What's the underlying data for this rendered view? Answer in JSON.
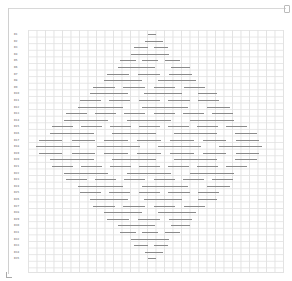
{
  "chart_data": {
    "type": "diamond-grid",
    "title": "",
    "row_count": 35,
    "row_labels": [
      "R1",
      "R2",
      "R3",
      "R4",
      "R5",
      "R6",
      "R7",
      "R8",
      "R9",
      "R10",
      "R11",
      "R12",
      "R13",
      "R14",
      "R15",
      "R16",
      "R17",
      "R18",
      "R19",
      "R20",
      "R21",
      "R22",
      "R23",
      "R24",
      "R25",
      "R26",
      "R27",
      "R28",
      "R29",
      "R30",
      "R31",
      "R32",
      "R33",
      "R34",
      "R35"
    ],
    "grid": {
      "columns": 30,
      "rows": 36,
      "on": true
    },
    "pattern": "diamond of horizontal dashes centered at column 15, widest at middle row"
  },
  "colors": {
    "grid": "#e2e2e2",
    "segment": "#8a8a8a",
    "label": "#555555"
  }
}
